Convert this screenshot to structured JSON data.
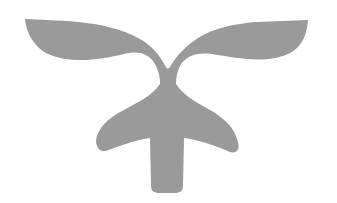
{
  "image": {
    "subject": "sprout-emblem-icon",
    "description": "Gray emblem of a sprout with two leaves atop a tree/plant-shaped body with a vertical stem",
    "colors": {
      "background": "#ffffff",
      "fill": "#9a9a9a"
    }
  }
}
